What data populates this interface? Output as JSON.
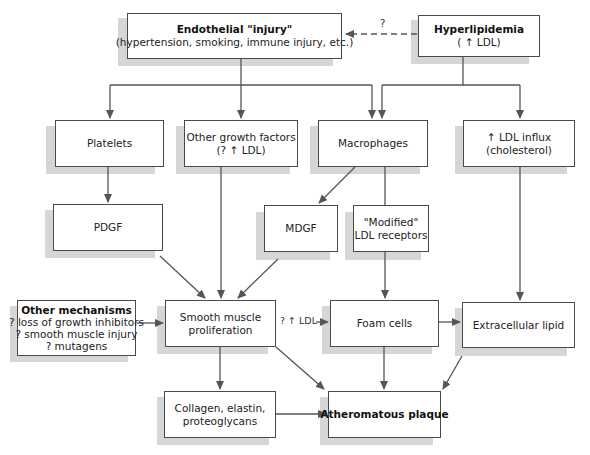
{
  "diagram": {
    "nodes": {
      "endothelial": {
        "title": "Endothelial \"injury\"",
        "sub": "(hypertension, smoking, immune injury, etc.)"
      },
      "hyperlipidemia": {
        "title": "Hyperlipidemia",
        "sub": "( ↑ LDL)"
      },
      "platelets": {
        "text": "Platelets"
      },
      "other_growth": {
        "line1": "Other growth factors",
        "line2": "(? ↑ LDL)"
      },
      "macrophages": {
        "text": "Macrophages"
      },
      "ldl_influx": {
        "line1": "↑ LDL influx",
        "line2": "(cholesterol)"
      },
      "pdgf": {
        "text": "PDGF"
      },
      "mdgf": {
        "text": "MDGF"
      },
      "modified_ldl": {
        "line1": "\"Modified\"",
        "line2": "LDL receptors"
      },
      "other_mechanisms": {
        "title": "Other mechanisms",
        "line1": "? loss of growth inhibitors",
        "line2": "? smooth muscle injury",
        "line3": "? mutagens"
      },
      "smooth_muscle": {
        "line1": "Smooth muscle",
        "line2": "proliferation"
      },
      "foam_cells": {
        "text": "Foam cells"
      },
      "extracellular_lipid": {
        "text": "Extracellular lipid"
      },
      "collagen": {
        "line1": "Collagen, elastin,",
        "line2": "proteoglycans"
      },
      "atheromatous": {
        "title": "Atheromatous plaque"
      }
    },
    "edge_labels": {
      "hyper_to_endo": "?",
      "ldl_to_foam": "? ↑ LDL"
    },
    "edges": [
      {
        "from": "hyperlipidemia",
        "to": "endothelial",
        "style": "dashed",
        "label": "?"
      },
      {
        "from": "endothelial",
        "to": "platelets"
      },
      {
        "from": "endothelial",
        "to": "other_growth"
      },
      {
        "from": "endothelial",
        "to": "macrophages"
      },
      {
        "from": "hyperlipidemia",
        "to": "macrophages"
      },
      {
        "from": "hyperlipidemia",
        "to": "ldl_influx"
      },
      {
        "from": "platelets",
        "to": "pdgf"
      },
      {
        "from": "macrophages",
        "to": "mdgf"
      },
      {
        "from": "macrophages",
        "to": "modified_ldl"
      },
      {
        "from": "pdgf",
        "to": "smooth_muscle"
      },
      {
        "from": "other_growth",
        "to": "smooth_muscle"
      },
      {
        "from": "mdgf",
        "to": "smooth_muscle"
      },
      {
        "from": "other_mechanisms",
        "to": "smooth_muscle"
      },
      {
        "from": "smooth_muscle",
        "to": "foam_cells",
        "label": "? ↑ LDL"
      },
      {
        "from": "modified_ldl",
        "to": "foam_cells"
      },
      {
        "from": "ldl_influx",
        "to": "extracellular_lipid"
      },
      {
        "from": "foam_cells",
        "to": "extracellular_lipid"
      },
      {
        "from": "smooth_muscle",
        "to": "collagen"
      },
      {
        "from": "smooth_muscle",
        "to": "atheromatous"
      },
      {
        "from": "collagen",
        "to": "atheromatous"
      },
      {
        "from": "foam_cells",
        "to": "atheromatous"
      },
      {
        "from": "extracellular_lipid",
        "to": "atheromatous"
      }
    ],
    "colors": {
      "line": "#555555",
      "border": "#4a4a4a",
      "shadow": "#d6d6d6",
      "background": "#ffffff"
    }
  }
}
